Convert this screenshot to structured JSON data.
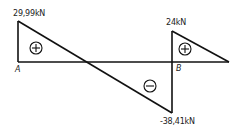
{
  "diagram": {
    "type": "shear-force-diagram",
    "values": {
      "left_max": "29,99kN",
      "right_max": "24kN",
      "min": "-38,41kN"
    },
    "points": {
      "a": "A",
      "b": "B"
    },
    "signs": {
      "positive": "+",
      "negative": "−"
    },
    "colors": {
      "line": "#111111",
      "text": "#222222"
    }
  }
}
